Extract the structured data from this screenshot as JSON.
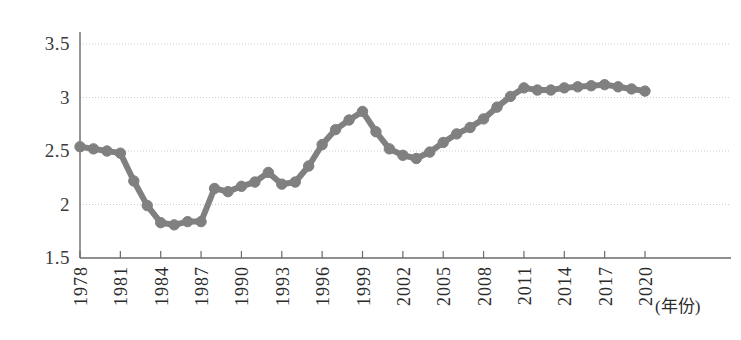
{
  "chart_data": {
    "type": "line",
    "title": "",
    "subtitle": "",
    "xlabel": "(年份)",
    "ylabel": "",
    "xlim": [
      1978,
      2020
    ],
    "ylim": [
      1.5,
      3.5
    ],
    "y_ticks": [
      "1.5",
      "2",
      "2.5",
      "3",
      "3.5"
    ],
    "y_tick_values": [
      1.5,
      2,
      2.5,
      3,
      3.5
    ],
    "x_ticks": [
      "1978",
      "1981",
      "1984",
      "1987",
      "1990",
      "1993",
      "1996",
      "1999",
      "2002",
      "2005",
      "2008",
      "2011",
      "2014",
      "2017",
      "2020"
    ],
    "x_tick_values": [
      1978,
      1981,
      1984,
      1987,
      1990,
      1993,
      1996,
      1999,
      2002,
      2005,
      2008,
      2011,
      2014,
      2017,
      2020
    ],
    "grid": "horizontal",
    "legend": null,
    "marker": "circle",
    "series_color": "#808080",
    "series": [
      {
        "name": "",
        "x": [
          1978,
          1979,
          1980,
          1981,
          1982,
          1983,
          1984,
          1985,
          1986,
          1987,
          1988,
          1989,
          1990,
          1991,
          1992,
          1993,
          1994,
          1995,
          1996,
          1997,
          1998,
          1999,
          2000,
          2001,
          2002,
          2003,
          2004,
          2005,
          2006,
          2007,
          2008,
          2009,
          2010,
          2011,
          2012,
          2013,
          2014,
          2015,
          2016,
          2017,
          2018,
          2019,
          2020
        ],
        "values": [
          2.54,
          2.52,
          2.5,
          2.48,
          2.22,
          1.99,
          1.82,
          1.81,
          1.84,
          1.83,
          2.15,
          2.12,
          2.17,
          2.21,
          2.3,
          2.19,
          2.2,
          2.36,
          2.55,
          2.68,
          2.78,
          2.8,
          2.87,
          2.67,
          2.51,
          2.46,
          2.43,
          2.48,
          2.57,
          2.66,
          2.72,
          2.79,
          2.9,
          3.0,
          3.09,
          3.08,
          3.08,
          3.09,
          3.1,
          3.11,
          3.12,
          3.11,
          3.09
        ]
      }
    ],
    "series_full": {
      "1978": 2.54,
      "1979": 2.52,
      "1980": 2.5,
      "1981": 2.48,
      "1982": 2.22,
      "1983": 1.99,
      "1984": 1.82,
      "1985": 1.81,
      "1986": 1.84,
      "1987": 1.83,
      "1988": 2.15,
      "1989": 2.12,
      "1990": 2.17,
      "1991": 2.21,
      "1992": 2.3,
      "1993": 2.19,
      "1994": 2.2,
      "1995": 2.36,
      "1996": 2.55,
      "1997": 2.68,
      "1998": 2.78,
      "1999": 2.8,
      "2000": 2.87,
      "2001": 2.67,
      "2002": 2.51,
      "2003": 2.46,
      "2004": 2.43,
      "2005": 2.48,
      "2006": 2.57,
      "2007": 2.66,
      "2008": 2.72,
      "2009": 2.79,
      "2010": 2.9,
      "2011": 3.0,
      "2012": 3.09,
      "2013": 3.08,
      "2014": 3.08,
      "2015": 3.09,
      "2016": 3.1,
      "2017": 3.11,
      "2018": 3.12,
      "2019": 3.11,
      "2020": 3.09
    },
    "points": [
      {
        "year": 1978,
        "value": 2.54
      },
      {
        "year": 1979,
        "value": 2.52
      },
      {
        "year": 1980,
        "value": 2.5
      },
      {
        "year": 1981,
        "value": 2.48
      },
      {
        "year": 1982,
        "value": 2.22
      },
      {
        "year": 1983,
        "value": 1.99
      },
      {
        "year": 1984,
        "value": 1.83
      },
      {
        "year": 1985,
        "value": 1.81
      },
      {
        "year": 1986,
        "value": 1.84
      },
      {
        "year": 1987,
        "value": 1.84
      },
      {
        "year": 1988,
        "value": 2.15
      },
      {
        "year": 1989,
        "value": 2.12
      },
      {
        "year": 1990,
        "value": 2.17
      },
      {
        "year": 1991,
        "value": 2.21
      },
      {
        "year": 1992,
        "value": 2.3
      },
      {
        "year": 1993,
        "value": 2.19
      },
      {
        "year": 1994,
        "value": 2.21
      },
      {
        "year": 1995,
        "value": 2.36
      },
      {
        "year": 1996,
        "value": 2.56
      },
      {
        "year": 1997,
        "value": 2.7
      },
      {
        "year": 1998,
        "value": 2.79
      },
      {
        "year": 1999,
        "value": 2.87
      },
      {
        "year": 2000,
        "value": 2.68
      },
      {
        "year": 2001,
        "value": 2.52
      },
      {
        "year": 2002,
        "value": 2.46
      },
      {
        "year": 2003,
        "value": 2.43
      },
      {
        "year": 2004,
        "value": 2.49
      },
      {
        "year": 2005,
        "value": 2.58
      },
      {
        "year": 2006,
        "value": 2.66
      },
      {
        "year": 2007,
        "value": 2.72
      },
      {
        "year": 2008,
        "value": 2.8
      },
      {
        "year": 2009,
        "value": 2.91
      },
      {
        "year": 2010,
        "value": 3.01
      },
      {
        "year": 2011,
        "value": 3.09
      },
      {
        "year": 2012,
        "value": 3.07
      },
      {
        "year": 2013,
        "value": 3.07
      },
      {
        "year": 2014,
        "value": 3.09
      },
      {
        "year": 2015,
        "value": 3.1
      },
      {
        "year": 2016,
        "value": 3.11
      },
      {
        "year": 2017,
        "value": 3.12
      },
      {
        "year": 2018,
        "value": 3.1
      },
      {
        "year": 2019,
        "value": 3.08
      },
      {
        "year": 2020,
        "value": 3.06
      }
    ]
  },
  "axes": {
    "y_labels": [
      "3.5",
      "3",
      "2.5",
      "2",
      "1.5"
    ],
    "x_labels": [
      "1978",
      "1981",
      "1984",
      "1987",
      "1990",
      "1993",
      "1996",
      "1999",
      "2002",
      "2005",
      "2008",
      "2011",
      "2014",
      "2017",
      "2020"
    ],
    "x_axis_title": "(年份)"
  },
  "colors": {
    "series": "#808080",
    "grid": "#c8cdd6",
    "axis": "#6a6a6a",
    "text": "#2b2b2b",
    "background": "#ffffff"
  }
}
